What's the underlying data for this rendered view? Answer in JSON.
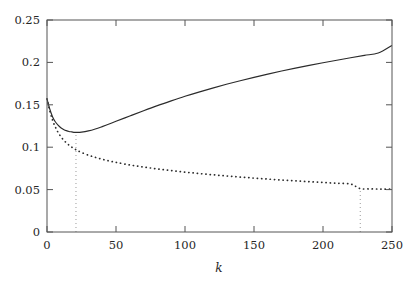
{
  "chart_data": {
    "type": "line",
    "title": "",
    "xlabel": "k",
    "ylabel": "",
    "xlim": [
      0,
      250
    ],
    "ylim": [
      0,
      0.25
    ],
    "grid": false,
    "legend": "none",
    "xticks": [
      0,
      50,
      100,
      150,
      200,
      250
    ],
    "xtick_labels": [
      "0",
      "50",
      "100",
      "150",
      "200",
      "250"
    ],
    "yticks": [
      0,
      0.05,
      0.1,
      0.15,
      0.2,
      0.25
    ],
    "ytick_labels": [
      "0",
      "0.05",
      "0.1",
      "0.15",
      "0.2",
      "0.25"
    ],
    "series": [
      {
        "name": "solid-curve",
        "style": "solid",
        "color": "#2b2b2b",
        "x": [
          0,
          2,
          4,
          6,
          8,
          10,
          12,
          14,
          16,
          18,
          20,
          22,
          25,
          30,
          35,
          40,
          45,
          50,
          60,
          70,
          80,
          90,
          100,
          110,
          120,
          130,
          140,
          150,
          160,
          170,
          180,
          190,
          200,
          210,
          220,
          230,
          240,
          250
        ],
        "y": [
          0.157,
          0.145,
          0.136,
          0.13,
          0.126,
          0.123,
          0.121,
          0.1195,
          0.1185,
          0.118,
          0.1175,
          0.1174,
          0.1177,
          0.1192,
          0.1215,
          0.1243,
          0.1273,
          0.1305,
          0.1368,
          0.143,
          0.149,
          0.1546,
          0.16,
          0.165,
          0.1697,
          0.1742,
          0.1784,
          0.1824,
          0.1862,
          0.1898,
          0.1932,
          0.1965,
          0.1996,
          0.2026,
          0.2055,
          0.2083,
          0.211,
          0.22
        ]
      },
      {
        "name": "dotted-curve",
        "style": "dotted",
        "color": "#2b2b2b",
        "x": [
          0,
          2,
          4,
          6,
          8,
          10,
          12,
          14,
          16,
          18,
          20,
          22,
          25,
          30,
          35,
          40,
          45,
          50,
          60,
          70,
          80,
          90,
          100,
          110,
          120,
          130,
          140,
          150,
          160,
          170,
          180,
          190,
          200,
          210,
          220,
          227,
          235,
          243,
          250
        ],
        "y": [
          0.157,
          0.143,
          0.132,
          0.124,
          0.1175,
          0.1125,
          0.1085,
          0.1052,
          0.1024,
          0.1,
          0.0979,
          0.0961,
          0.0938,
          0.0906,
          0.088,
          0.0858,
          0.0838,
          0.0821,
          0.0791,
          0.0766,
          0.0744,
          0.0724,
          0.0706,
          0.069,
          0.0675,
          0.0661,
          0.0648,
          0.0636,
          0.0624,
          0.0613,
          0.0603,
          0.0593,
          0.0584,
          0.0575,
          0.0566,
          0.0512,
          0.0508,
          0.0506,
          0.0505
        ]
      }
    ],
    "annotations": [
      {
        "name": "left-vertical-marker",
        "type": "vertical-dotted-line",
        "x": 21,
        "y_from": 0,
        "y_to": 0.1175
      },
      {
        "name": "right-vertical-marker",
        "type": "vertical-dotted-line",
        "x": 227,
        "y_from": 0,
        "y_to": 0.051
      }
    ]
  }
}
